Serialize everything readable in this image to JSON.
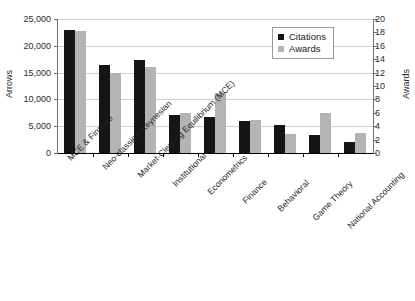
{
  "chart_data": {
    "type": "bar",
    "title": "",
    "subtitle": "",
    "xlabel": "",
    "ylabel": "Arrows",
    "y2label": "Awards",
    "categories": [
      "MCE & Finance",
      "Neo-classical Keynesian",
      "Market-Clearing Equilibrium (MCE)",
      "Institutional",
      "Econometrics",
      "Finance",
      "Behavioral",
      "Game Theory",
      "National Accounting"
    ],
    "series": [
      {
        "name": "Citations",
        "axis": "left",
        "color": "#151515",
        "values": [
          23000,
          16400,
          17300,
          7000,
          6800,
          5900,
          5200,
          3400,
          2100
        ]
      },
      {
        "name": "Awards",
        "axis": "right",
        "color": "#b4b4b4",
        "values": [
          18.2,
          11.9,
          12.9,
          5.9,
          9.0,
          5.0,
          2.8,
          6.0,
          3.0
        ]
      }
    ],
    "ylim": [
      0,
      25000
    ],
    "y2lim": [
      0,
      20
    ],
    "yticks": [
      0,
      5000,
      10000,
      15000,
      20000,
      25000
    ],
    "ytick_labels": [
      "0",
      "5,000",
      "10,000",
      "15,000",
      "20,000",
      "25,000"
    ],
    "y2ticks": [
      0,
      2,
      4,
      6,
      8,
      10,
      12,
      14,
      16,
      18,
      20
    ],
    "y2tick_labels": [
      "0",
      "2",
      "4",
      "6",
      "8",
      "10",
      "12",
      "14",
      "16",
      "18",
      "20"
    ],
    "grid": true,
    "grid_axis": "y",
    "legend": [
      "Citations",
      "Awards"
    ],
    "legend_position": "upper-right-inside"
  }
}
